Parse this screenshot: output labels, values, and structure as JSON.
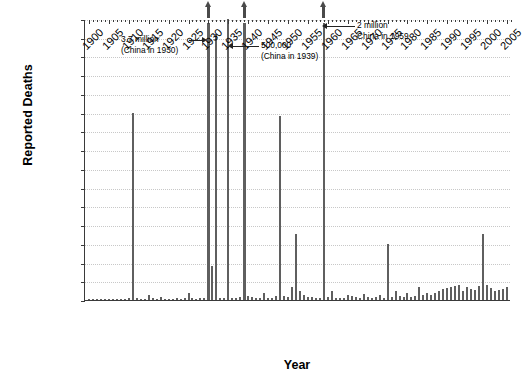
{
  "chart_data": {
    "type": "bar",
    "title": "",
    "xlabel": "Year",
    "ylabel": "Reported Deaths",
    "xlim": [
      1899,
      2006
    ],
    "ylim": [
      0,
      150000
    ],
    "ytick_step": 10000,
    "grid": true,
    "legend": "none",
    "bar_color": "#5f5f5f",
    "ytick_labels": [
      "150,000",
      "140,000",
      "130,000",
      "120,000",
      "110,000",
      "100,000",
      "90,000",
      "80,000",
      "70,000",
      "60,000",
      "50,000",
      "40,000",
      "30,000",
      "20,000",
      "10,000",
      "0"
    ],
    "xtick_labels": [
      "1900",
      "1905",
      "1910",
      "1915",
      "1920",
      "1925",
      "1930",
      "1935",
      "1940",
      "1945",
      "1950",
      "1955",
      "1960",
      "1965",
      "1970",
      "1975",
      "1980",
      "1985",
      "1990",
      "1995",
      "2000",
      "2005"
    ],
    "x": [
      1900,
      1901,
      1902,
      1903,
      1904,
      1905,
      1906,
      1907,
      1908,
      1909,
      1910,
      1911,
      1912,
      1913,
      1914,
      1915,
      1916,
      1917,
      1918,
      1919,
      1920,
      1921,
      1922,
      1923,
      1924,
      1925,
      1926,
      1927,
      1928,
      1929,
      1930,
      1931,
      1932,
      1933,
      1934,
      1935,
      1936,
      1937,
      1938,
      1939,
      1940,
      1941,
      1942,
      1943,
      1944,
      1945,
      1946,
      1947,
      1948,
      1949,
      1950,
      1951,
      1952,
      1953,
      1954,
      1955,
      1956,
      1957,
      1958,
      1959,
      1960,
      1961,
      1962,
      1963,
      1964,
      1965,
      1966,
      1967,
      1968,
      1969,
      1970,
      1971,
      1972,
      1973,
      1974,
      1975,
      1976,
      1977,
      1978,
      1979,
      1980,
      1981,
      1982,
      1983,
      1984,
      1985,
      1986,
      1987,
      1988,
      1989,
      1990,
      1991,
      1992,
      1993,
      1994,
      1995,
      1996,
      1997,
      1998,
      1999,
      2000,
      2001,
      2002,
      2003,
      2004,
      2005
    ],
    "values": [
      400,
      300,
      600,
      500,
      400,
      700,
      500,
      400,
      600,
      800,
      1200,
      100000,
      900,
      700,
      600,
      2500,
      900,
      700,
      1500,
      800,
      700,
      600,
      900,
      700,
      1200,
      3500,
      900,
      700,
      1100,
      900,
      150000,
      18000,
      142000,
      1300,
      900,
      150000,
      1200,
      900,
      1500,
      150000,
      2000,
      1500,
      1200,
      1000,
      3500,
      900,
      1200,
      2000,
      98000,
      2000,
      1500,
      7000,
      35000,
      5000,
      2500,
      1800,
      1500,
      1200,
      1000,
      150000,
      1500,
      5000,
      1200,
      1000,
      900,
      2500,
      2000,
      1500,
      1200,
      3000,
      1500,
      1200,
      1500,
      2500,
      1200,
      30000,
      1500,
      5000,
      2000,
      1800,
      3500,
      1500,
      2000,
      7000,
      2500,
      3500,
      2500,
      4000,
      5000,
      6000,
      6500,
      7000,
      7500,
      8000,
      5000,
      7000,
      6000,
      5500,
      7500,
      35000,
      8000,
      6500,
      5000,
      5500,
      6000,
      7000
    ],
    "clipped_bars": [
      1930,
      1939,
      1959
    ],
    "clipped_note": "Bars for 1930, 1939 and 1959 exceed the 150,000 axis maximum and are drawn with an upward arrow cap.",
    "annotations": [
      {
        "id": "a1930",
        "line1": "3.7 million",
        "line2": "(China in 1930)",
        "target_year": 1930,
        "direction": "right"
      },
      {
        "id": "a1939",
        "line1": "500,000",
        "line2": "(China in 1939)",
        "target_year": 1939,
        "direction": "left"
      },
      {
        "id": "a1959",
        "line1": "2 million",
        "line2": "China in 1959",
        "target_year": 1959,
        "direction": "left"
      }
    ]
  },
  "caption": {
    "cropped_text": ""
  }
}
